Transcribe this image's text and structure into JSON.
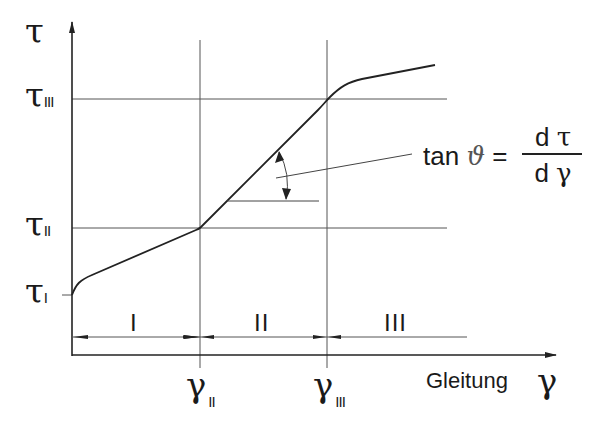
{
  "diagram": {
    "type": "stress-strain curve (shear)",
    "y_axis": {
      "symbol": "τ"
    },
    "x_axis": {
      "label": "Gleitung",
      "symbol": "γ"
    },
    "y_levels": [
      {
        "symbol": "τ",
        "subscript": "I"
      },
      {
        "symbol": "τ",
        "subscript": "II"
      },
      {
        "symbol": "τ",
        "subscript": "III"
      }
    ],
    "x_levels": [
      {
        "symbol": "γ",
        "subscript": "II"
      },
      {
        "symbol": "γ",
        "subscript": "III"
      }
    ],
    "regions": [
      "I",
      "II",
      "III"
    ],
    "formula": {
      "lhs": "tan",
      "angle": "ϑ",
      "equals": "=",
      "numerator_d": "d",
      "numerator_sym": "τ",
      "denominator_d": "d",
      "denominator_sym": "γ"
    },
    "colors": {
      "line": "#222222",
      "grid": "#555555"
    }
  }
}
